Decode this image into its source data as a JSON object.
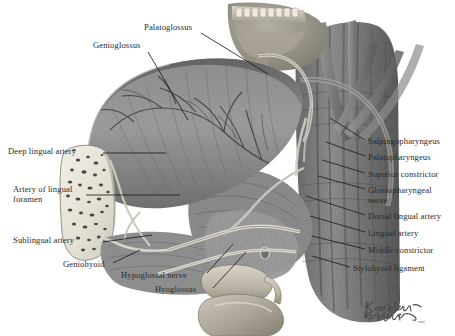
{
  "plate": {
    "title": "Tongue, floor of mouth and pharyngeal wall dissection",
    "width": 455,
    "height": 336,
    "background": "#ffffff",
    "ink": "#2b2b2b",
    "leader_color": "#1d1d1d",
    "style": "grayscale medical illustration"
  },
  "labels": {
    "top": [
      {
        "id": "palatoglossus",
        "text": "Palatoglossus",
        "x": 144,
        "y": 27,
        "side": "top"
      },
      {
        "id": "genioglossus",
        "text": "Genioglossus",
        "x": 93,
        "y": 45,
        "side": "top"
      }
    ],
    "left": [
      {
        "id": "deep-lingual-artery",
        "text": "Deep lingual artery",
        "x": 8,
        "y": 150
      },
      {
        "id": "artery-of-lingual-foramen",
        "text": "Artery of lingual",
        "x": 13,
        "y": 188,
        "line2": "foramen"
      },
      {
        "id": "sublingual-artery",
        "text": "Sublingual artery",
        "x": 13,
        "y": 239
      }
    ],
    "bottom": [
      {
        "id": "geniohyoid",
        "text": "Geniohyoid",
        "x": 63,
        "y": 264
      },
      {
        "id": "hypoglossal-nerve",
        "text": "Hypoglossal nerve",
        "x": 121,
        "y": 275
      },
      {
        "id": "hyoglossus",
        "text": "Hyoglossus",
        "x": 155,
        "y": 289
      }
    ],
    "right": [
      {
        "id": "salpingopharyngeus",
        "text": "Salpingopharyngeus",
        "x": 368,
        "y": 141
      },
      {
        "id": "palatopharyngeus",
        "text": "Palatopharyngeus",
        "x": 368,
        "y": 157
      },
      {
        "id": "superior-constrictor",
        "text": "Superior constrictor",
        "x": 368,
        "y": 174
      },
      {
        "id": "glossopharyngeal-nerve",
        "text": "Glossopharyngeal",
        "x": 368,
        "y": 190,
        "line2": "nerve"
      },
      {
        "id": "dorsal-lingual-artery",
        "text": "Dorsal lingual artery",
        "x": 368,
        "y": 216
      },
      {
        "id": "lingual-artery",
        "text": "Lingual artery",
        "x": 368,
        "y": 233
      },
      {
        "id": "middle-constrictor",
        "text": "Middle constrictor",
        "x": 368,
        "y": 250
      },
      {
        "id": "stylohyoid-ligament",
        "text": "Stylohyoid ligament",
        "x": 353,
        "y": 268
      }
    ]
  },
  "signature": {
    "line1": "K. Carter",
    "line2": "B. Dallance",
    "suffix": "cmi",
    "x": 364,
    "y": 300
  }
}
